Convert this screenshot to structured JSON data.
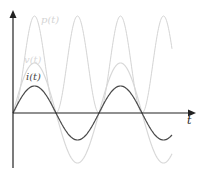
{
  "chart_data": {
    "type": "line",
    "title": "",
    "xlabel": "t",
    "ylabel": "",
    "grid": false,
    "legend": "inline labels",
    "axes": {
      "origin_px": [
        13,
        113
      ],
      "x_end_px": 196,
      "y_top_px": 10,
      "y_bottom_px": 168,
      "color": "#222222"
    },
    "series": [
      {
        "name": "p(t)",
        "label": "p(t)",
        "kind": "sin_squared",
        "amplitude_px": 97,
        "period_px": 86,
        "phase_px": 0,
        "x_start_px": 13,
        "x_end_px": 172,
        "color": "#d4d4d4",
        "width": 1,
        "label_pos": [
          41,
          23
        ]
      },
      {
        "name": "v(t)",
        "label": "v(t)",
        "kind": "sin",
        "amplitude_px": 50,
        "period_px": 86,
        "phase_px": 0,
        "x_start_px": 13,
        "x_end_px": 172,
        "color": "#d8d8d8",
        "width": 1.2,
        "label_pos": [
          24,
          63
        ]
      },
      {
        "name": "i(t)",
        "label": "i(t)",
        "kind": "sin",
        "amplitude_px": 27,
        "period_px": 86,
        "phase_px": 0,
        "x_start_px": 13,
        "x_end_px": 172,
        "color": "#4a4a4a",
        "width": 1.2,
        "label_pos": [
          26,
          80
        ]
      }
    ],
    "x_axis_label": {
      "text": "t",
      "pos": [
        187,
        124
      ]
    }
  }
}
